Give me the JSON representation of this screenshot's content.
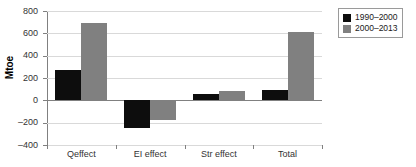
{
  "chart_data": {
    "type": "bar",
    "title": "",
    "xlabel": "",
    "ylabel": "Mtoe",
    "categories": [
      "Qeffect",
      "EI effect",
      "Str effect",
      "Total"
    ],
    "series": [
      {
        "name": "1990–2000",
        "color": "#0d0d0d",
        "values": [
          270,
          -250,
          60,
          90
        ]
      },
      {
        "name": "2000–2013",
        "color": "#808080",
        "values": [
          690,
          -175,
          80,
          610
        ]
      }
    ],
    "ylim": [
      -400,
      800
    ],
    "yticks": [
      800,
      600,
      400,
      200,
      0,
      -200,
      -400
    ],
    "ytick_labels": [
      "800",
      "600",
      "400",
      "200",
      "0",
      "–200",
      "–400"
    ],
    "grid": true,
    "legend_position": "right-top"
  }
}
